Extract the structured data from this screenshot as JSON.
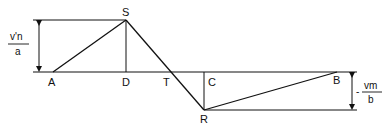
{
  "diagram": {
    "points": {
      "A": {
        "label": "A",
        "x": 53,
        "y": 72
      },
      "S": {
        "label": "S",
        "x": 126,
        "y": 20
      },
      "D": {
        "label": "D",
        "x": 126,
        "y": 72
      },
      "T": {
        "label": "T",
        "x": 170,
        "y": 72
      },
      "C": {
        "label": "C",
        "x": 204,
        "y": 72
      },
      "R": {
        "label": "R",
        "x": 204,
        "y": 110
      },
      "B": {
        "label": "B",
        "x": 337,
        "y": 72
      }
    },
    "left_dimension": {
      "numerator": "v'n",
      "denominator": "a"
    },
    "right_dimension": {
      "sign": "-",
      "numerator": "vm",
      "denominator": "b"
    },
    "colors": {
      "stroke": "#111111",
      "background": "#ffffff"
    }
  }
}
